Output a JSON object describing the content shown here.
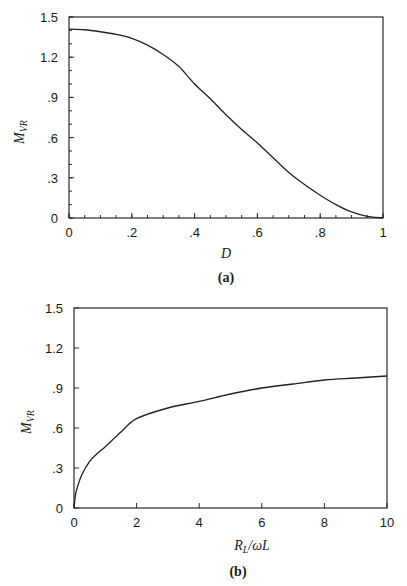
{
  "chart_data": [
    {
      "type": "line",
      "panel_label": "(a)",
      "title": "",
      "xlabel": "D",
      "ylabel": "M_VR",
      "ylabel_main": "M",
      "ylabel_sub": "VR",
      "xlim": [
        0,
        1
      ],
      "ylim": [
        0,
        1.5
      ],
      "grid": false,
      "x_ticks": [
        0,
        0.2,
        0.4,
        0.6,
        0.8,
        1
      ],
      "x_tick_labels": [
        "0",
        ".2",
        ".4",
        ".6",
        ".8",
        "1"
      ],
      "x_minor_step": 0.05,
      "y_ticks": [
        0,
        0.3,
        0.6,
        0.9,
        1.2,
        1.5
      ],
      "y_tick_labels": [
        "0",
        ".3",
        ".6",
        ".9",
        "1.2",
        "1.5"
      ],
      "y_minor_step": 0.1,
      "series": [
        {
          "name": "M_VR vs D",
          "x": [
            0,
            0.05,
            0.1,
            0.15,
            0.2,
            0.25,
            0.3,
            0.35,
            0.4,
            0.45,
            0.5,
            0.55,
            0.6,
            0.65,
            0.7,
            0.75,
            0.8,
            0.85,
            0.9,
            0.95,
            1.0
          ],
          "values": [
            1.41,
            1.405,
            1.39,
            1.37,
            1.34,
            1.29,
            1.22,
            1.13,
            1.0,
            0.89,
            0.77,
            0.66,
            0.56,
            0.45,
            0.34,
            0.25,
            0.17,
            0.1,
            0.045,
            0.012,
            0.0
          ]
        }
      ]
    },
    {
      "type": "line",
      "panel_label": "(b)",
      "title": "",
      "xlabel": "R_L/ωL",
      "xlabel_main": "R",
      "xlabel_sub": "L",
      "xlabel_rest": "/ωL",
      "ylabel": "M_VR",
      "ylabel_main": "M",
      "ylabel_sub": "VR",
      "xlim": [
        0,
        10
      ],
      "ylim": [
        0,
        1.5
      ],
      "grid": false,
      "x_ticks": [
        0,
        2,
        4,
        6,
        8,
        10
      ],
      "x_tick_labels": [
        "0",
        "2",
        "4",
        "6",
        "8",
        "10"
      ],
      "y_ticks": [
        0,
        0.3,
        0.6,
        0.9,
        1.2,
        1.5
      ],
      "y_tick_labels": [
        "0",
        ".3",
        ".6",
        ".9",
        "1.2",
        "1.5"
      ],
      "series": [
        {
          "name": "M_VR vs R_L/ωL",
          "x": [
            0,
            0.05,
            0.1,
            0.25,
            0.5,
            0.75,
            1,
            1.5,
            2,
            3,
            4,
            5,
            6,
            7,
            8,
            9,
            10
          ],
          "values": [
            0,
            0.1,
            0.15,
            0.25,
            0.35,
            0.41,
            0.46,
            0.57,
            0.67,
            0.75,
            0.8,
            0.855,
            0.9,
            0.93,
            0.96,
            0.975,
            0.99
          ]
        }
      ]
    }
  ],
  "panels": {
    "a": {
      "caption": "(a)"
    },
    "b": {
      "caption": "(b)"
    }
  }
}
